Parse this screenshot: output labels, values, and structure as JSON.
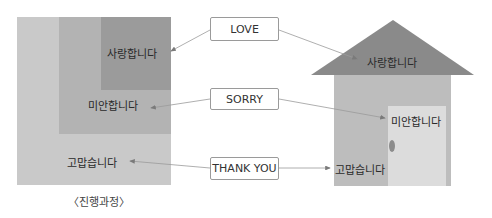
{
  "left_diagram": {
    "outer_label": "고맙습니다",
    "middle_label": "미안합니다",
    "inner_label": "사랑합니다",
    "caption": "〈진행과정〉"
  },
  "english_boxes": {
    "love": "LOVE",
    "sorry": "SORRY",
    "thank_you": "THANK YOU"
  },
  "house": {
    "roof_label": "사랑합니다",
    "door_label": "미안합니다",
    "body_label": "고맙습니다"
  },
  "colors": {
    "outer": "#c9c9c9",
    "middle": "#b3b3b3",
    "inner": "#9b9b9b",
    "roof": "#8a8a8a",
    "house_body": "#bdbdbd",
    "door": "#dcdcdc",
    "line": "#8c8c8c"
  }
}
